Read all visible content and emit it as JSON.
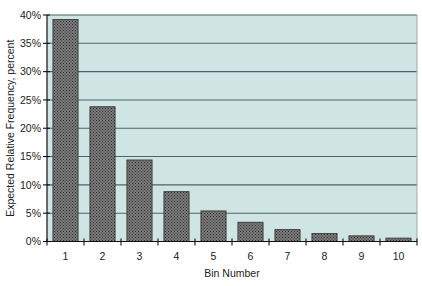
{
  "chart_data": {
    "type": "bar",
    "title": "",
    "xlabel": "Bin Number",
    "ylabel": "Expected Relative Frequency, percent",
    "categories": [
      "1",
      "2",
      "3",
      "4",
      "5",
      "6",
      "7",
      "8",
      "9",
      "10"
    ],
    "values": [
      39.2,
      23.8,
      14.4,
      8.8,
      5.4,
      3.4,
      2.1,
      1.4,
      1.0,
      0.6
    ],
    "ylim": [
      0,
      40
    ],
    "yticks": [
      0,
      5,
      10,
      15,
      20,
      25,
      30,
      35,
      40
    ],
    "ytick_labels": [
      "0%",
      "5%",
      "10%",
      "15%",
      "20%",
      "25%",
      "30%",
      "35%",
      "40%"
    ],
    "grid": true,
    "legend": "none",
    "colors": {
      "plot_background": "#cfe5e4",
      "bar_fill": "#6b6b6b",
      "bar_hatch": "#3c3c3c",
      "gridline": "#4f6464",
      "axis": "#111111"
    }
  }
}
